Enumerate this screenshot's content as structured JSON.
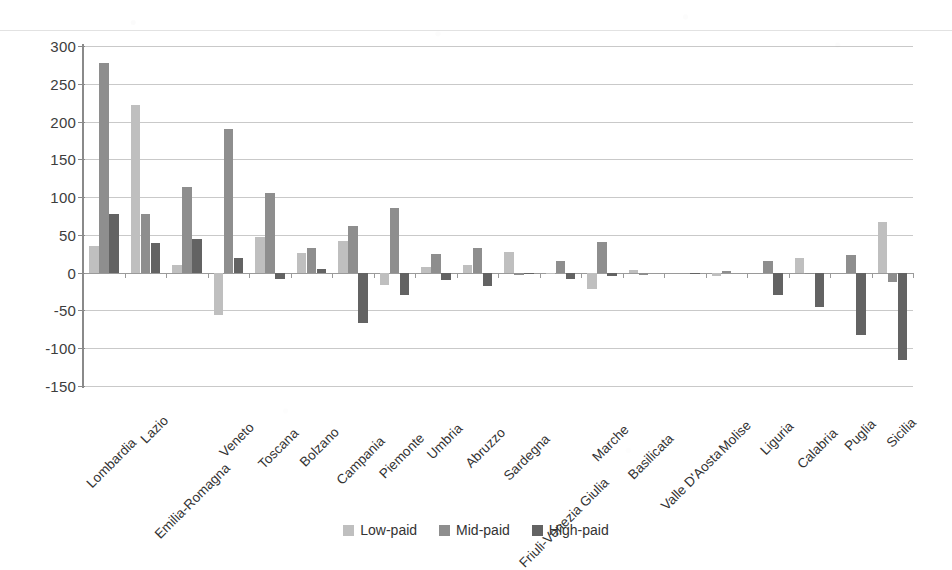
{
  "chart_data": {
    "type": "bar",
    "title": "",
    "subtitle": "",
    "xlabel": "",
    "ylabel": "",
    "ylim": [
      -150,
      300
    ],
    "ytick_step": 50,
    "yticks": [
      300,
      250,
      200,
      150,
      100,
      50,
      0,
      -50,
      -100,
      -150
    ],
    "grid": true,
    "legend_position": "bottom",
    "categories": [
      "Lombardia",
      "Lazio",
      "Emilia-Romagna",
      "Veneto",
      "Toscana",
      "Bolzano",
      "Campania",
      "Piemonte",
      "Umbria",
      "Abruzzo",
      "Sardegna",
      "Friuli-Venezia Giulia",
      "Marche",
      "Basilicata",
      "Valle D'Aosta",
      "Molise",
      "Liguria",
      "Calabria",
      "Puglia",
      "Sicilia"
    ],
    "series": [
      {
        "name": "Low-paid",
        "color": "#bfbfbf",
        "values": [
          35,
          222,
          10,
          -56,
          47,
          26,
          42,
          -16,
          8,
          10,
          27,
          -2,
          -22,
          4,
          0,
          -5,
          0,
          19,
          0,
          67
        ]
      },
      {
        "name": "Mid-paid",
        "color": "#8e8e8e",
        "values": [
          277,
          78,
          114,
          190,
          106,
          33,
          62,
          85,
          25,
          32,
          -3,
          15,
          41,
          -3,
          0,
          2,
          16,
          -1,
          23,
          -13
        ]
      },
      {
        "name": "High-paid",
        "color": "#636363",
        "values": [
          77,
          39,
          45,
          19,
          -8,
          5,
          -66,
          -30,
          -10,
          -17,
          -2,
          -9,
          -5,
          0,
          -1,
          0,
          -30,
          -45,
          -83,
          -115
        ]
      }
    ]
  },
  "legend": {
    "items": [
      {
        "label": "Low-paid",
        "swatch": "low"
      },
      {
        "label": "Mid-paid",
        "swatch": "mid"
      },
      {
        "label": "High-paid",
        "swatch": "high"
      }
    ]
  },
  "axis": {
    "y_tick_labels": [
      "300",
      "250",
      "200",
      "150",
      "100",
      "50",
      "0",
      "-50",
      "-100",
      "-150"
    ]
  }
}
